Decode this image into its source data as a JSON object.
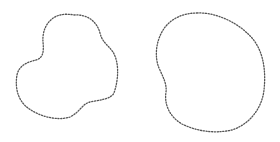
{
  "canvas": {
    "width": 280,
    "height": 142,
    "background": "#ffffff"
  },
  "shapes": [
    {
      "id": "left-blob",
      "description": "closed dotted irregular blob with a notch on the upper left",
      "stroke": "#555555",
      "path": "M 74 15 C 88 14, 97 22, 100 33 C 102 42, 108 45, 113 52 C 119 62, 119 78, 114 93 C 111 99, 100 100, 90 102 C 82 104, 80 112, 70 117 C 58 121, 40 117, 28 108 C 17 100, 15 86, 17 75 C 19 65, 28 62, 36 60 C 43 58, 44 52, 43 42 C 42 30, 48 18, 60 15 C 64 14, 69 14, 74 15 Z"
    },
    {
      "id": "right-blob",
      "description": "closed dotted irregular blob, larger, with a slight indentation on the left side",
      "stroke": "#555555",
      "path": "M 197 13 C 215 12, 238 22, 252 38 C 264 52, 266 72, 264 90 C 262 108, 250 124, 232 130 C 214 134, 196 131, 182 124 C 170 117, 164 105, 166 92 C 167 84, 163 77, 159 68 C 154 56, 156 38, 166 26 C 174 17, 185 13, 197 13 Z"
    }
  ]
}
